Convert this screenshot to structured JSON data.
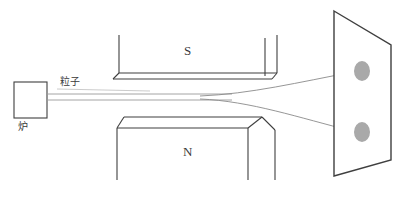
{
  "figure": {
    "background_color": "#ffffff",
    "stroke_color": "#3f3f3f",
    "beam_color": "#8a8a8a",
    "spot_color": "#a8a8a8",
    "width": 404,
    "height": 200
  },
  "labels": {
    "furnace": "炉",
    "particle_beam": "粒子",
    "south_pole": "S",
    "north_pole": "N"
  },
  "components": {
    "furnace_box": {
      "name": "furnace",
      "x": 14,
      "y": 82,
      "width": 33,
      "height": 36
    },
    "magnet_south": {
      "name": "south-pole-magnet",
      "label": "S",
      "label_x": 186,
      "label_y": 45,
      "left_x": 114,
      "right_x": 277,
      "top_y": 35,
      "bottom_y": 79
    },
    "magnet_north": {
      "name": "north-pole-magnet",
      "label": "N",
      "label_x": 186,
      "label_y": 146,
      "left_x": 117,
      "right_x": 275,
      "top_y": 117,
      "bottom_y": 180
    },
    "detector_screen": {
      "name": "detection-screen",
      "top_left": [
        334,
        11
      ],
      "top_right": [
        391,
        45
      ],
      "bottom_right": [
        391,
        160
      ],
      "bottom_left": [
        334,
        176
      ]
    },
    "spots": [
      {
        "name": "upper-impact-spot",
        "cx": 362,
        "cy": 71,
        "rx": 8,
        "ry": 10
      },
      {
        "name": "lower-impact-spot",
        "cx": 362,
        "cy": 132,
        "rx": 8,
        "ry": 10
      }
    ],
    "beams": {
      "source_top_y": 94,
      "source_bottom_y": 100,
      "split_x": 232,
      "upper_end": [
        353,
        72
      ],
      "lower_end": [
        352,
        131
      ]
    }
  }
}
